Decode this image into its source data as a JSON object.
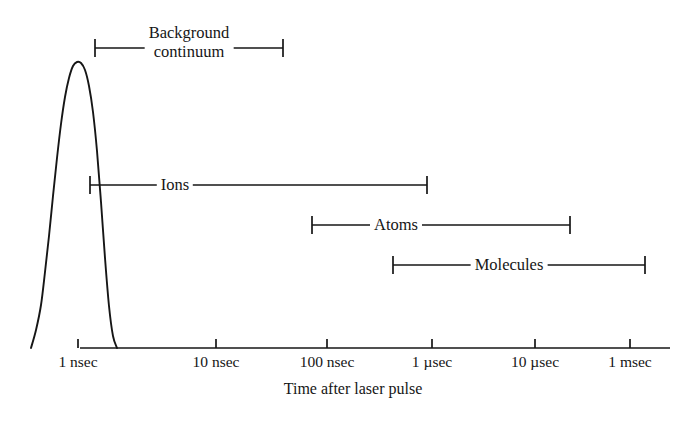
{
  "figure": {
    "background_color": "#ffffff",
    "line_color": "#161616",
    "axis_caption": "Time after laser pulse"
  },
  "axis": {
    "x_start_px": 80,
    "x_end_px": 670,
    "baseline_y_px": 348,
    "ticks": [
      {
        "label": "1 nsec",
        "x_px": 78
      },
      {
        "label": "10 nsec",
        "x_px": 216
      },
      {
        "label": "100 nsec",
        "x_px": 327
      },
      {
        "label": "1 µsec",
        "x_px": 432
      },
      {
        "label": "10 µsec",
        "x_px": 535
      },
      {
        "label": "1 msec",
        "x_px": 630
      }
    ]
  },
  "ranges": [
    {
      "name": "background-continuum",
      "label_line1": "Background",
      "label_line2": "continuum",
      "start_px": 95,
      "end_px": 283,
      "y_px": 48,
      "label_x_px": 189,
      "label_y_px": 42
    },
    {
      "name": "ions",
      "label_line1": "Ions",
      "label_line2": "",
      "start_px": 90,
      "end_px": 427,
      "y_px": 185,
      "label_x_px": 175,
      "label_y_px": 185
    },
    {
      "name": "atoms",
      "label_line1": "Atoms",
      "label_line2": "",
      "start_px": 312,
      "end_px": 570,
      "y_px": 225,
      "label_x_px": 396,
      "label_y_px": 225
    },
    {
      "name": "molecules",
      "label_line1": "Molecules",
      "label_line2": "",
      "start_px": 393,
      "end_px": 645,
      "y_px": 265,
      "label_x_px": 509,
      "label_y_px": 265
    }
  ],
  "chart_data": {
    "type": "line",
    "title": "",
    "subtitle": "",
    "xlabel": "Time after laser pulse",
    "ylabel": "",
    "x_scale": "log",
    "grid": false,
    "legend": "none",
    "xtick_labels": [
      "1 nsec",
      "10 nsec",
      "100 nsec",
      "1 µsec",
      "10 µsec",
      "1 msec"
    ],
    "xtick_values_sec": [
      1e-09,
      1e-08,
      1e-07,
      1e-06,
      1e-05,
      0.001
    ],
    "series": [
      {
        "name": "Laser pulse / emission intensity",
        "description": "Single narrow asymmetric peak near 1 nsec decaying to baseline before 10 nsec",
        "peak_x_px": 77,
        "peak_y_px": 62,
        "left_foot_x_px": 31,
        "right_foot_x_px": 117,
        "points_px": [
          [
            31,
            348
          ],
          [
            36,
            330
          ],
          [
            41,
            305
          ],
          [
            45,
            272
          ],
          [
            49,
            236
          ],
          [
            53,
            196
          ],
          [
            57,
            158
          ],
          [
            61,
            124
          ],
          [
            65,
            97
          ],
          [
            69,
            78
          ],
          [
            73,
            66
          ],
          [
            77,
            62
          ],
          [
            81,
            63
          ],
          [
            85,
            70
          ],
          [
            89,
            86
          ],
          [
            93,
            112
          ],
          [
            97,
            151
          ],
          [
            101,
            202
          ],
          [
            105,
            258
          ],
          [
            109,
            306
          ],
          [
            113,
            336
          ],
          [
            117,
            348
          ]
        ]
      }
    ],
    "annotations": [
      {
        "text": "Background continuum",
        "start_label": "1 nsec",
        "end_label": "~30 nsec"
      },
      {
        "text": "Ions",
        "start_label": "~1 nsec",
        "end_label": "~1 µsec"
      },
      {
        "text": "Atoms",
        "start_label": "~60 nsec",
        "end_label": "~30 µsec"
      },
      {
        "text": "Molecules",
        "start_label": "~400 nsec",
        "end_label": "~400 µsec"
      }
    ]
  }
}
